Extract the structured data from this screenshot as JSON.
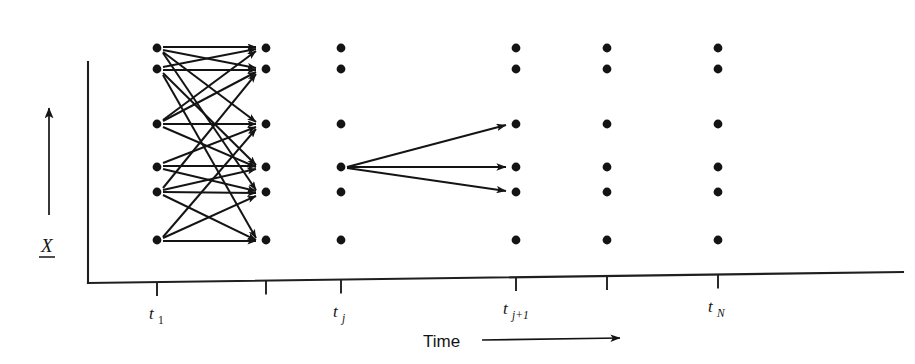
{
  "figure": {
    "caption_kind": "lattice-trellis-diagram",
    "background_color": "#ffffff",
    "ink_color": "#141414"
  },
  "axes": {
    "x_axis": {
      "title": "Time",
      "title_arrow_icon": "right-arrow-icon",
      "origin_x": 88,
      "origin_y": 283,
      "end_x": 903,
      "end_y": 272,
      "ticks": [
        {
          "id": "t1",
          "x": 157,
          "base": "t",
          "sub": "1"
        },
        {
          "id": "t2",
          "x": 266,
          "base": "",
          "sub": ""
        },
        {
          "id": "tj",
          "x": 341,
          "base": "t",
          "sub": "j"
        },
        {
          "id": "tj1",
          "x": 516,
          "base": "t",
          "sub": "j+1"
        },
        {
          "id": "tk",
          "x": 607,
          "base": "",
          "sub": ""
        },
        {
          "id": "tN",
          "x": 718,
          "base": "t",
          "sub": "N"
        }
      ]
    },
    "y_axis": {
      "title": "X",
      "title_style": "underlined-italic-vector",
      "arrow_icon": "up-arrow-icon",
      "top_y": 62,
      "bottom_y": 283,
      "x": 88
    }
  },
  "lattice": {
    "row_y": [
      48,
      69,
      124,
      167,
      192,
      240
    ],
    "column_x": [
      157,
      266,
      341,
      516,
      607,
      718
    ],
    "dot_radius": 4.4,
    "dot_count_per_column": 6
  },
  "transitions": {
    "left_cluster": {
      "description": "dense many-to-many transitions between column 1 and column 2",
      "from_column": 0,
      "to_column": 1,
      "edges": [
        [
          0,
          0
        ],
        [
          0,
          1
        ],
        [
          0,
          2
        ],
        [
          0,
          4
        ],
        [
          1,
          0
        ],
        [
          1,
          1
        ],
        [
          1,
          3
        ],
        [
          1,
          5
        ],
        [
          2,
          0
        ],
        [
          2,
          1
        ],
        [
          2,
          2
        ],
        [
          2,
          3
        ],
        [
          3,
          2
        ],
        [
          3,
          3
        ],
        [
          3,
          4
        ],
        [
          4,
          1
        ],
        [
          4,
          3
        ],
        [
          4,
          4
        ],
        [
          4,
          5
        ],
        [
          5,
          2
        ],
        [
          5,
          4
        ],
        [
          5,
          5
        ]
      ]
    },
    "fan_out": {
      "description": "single-state fan-out from t_j to t_j+1",
      "from_column": 2,
      "from_row": 3,
      "to_column": 3,
      "to_rows": [
        2,
        3,
        4
      ]
    }
  }
}
